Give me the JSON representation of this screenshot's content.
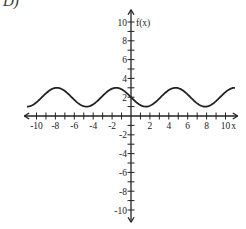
{
  "problem_label": "D)",
  "chart_data": {
    "type": "line",
    "title": "",
    "xlabel": "x",
    "ylabel": "f(x)",
    "xlim": [
      -11,
      11
    ],
    "ylim": [
      -11,
      11
    ],
    "x_ticks": [
      -10,
      -8,
      -6,
      -4,
      -2,
      2,
      4,
      6,
      8,
      10
    ],
    "y_ticks": [
      -10,
      -8,
      -6,
      -4,
      -2,
      2,
      4,
      6,
      8,
      10
    ],
    "grid": false,
    "function": "f(x) = 2 - sin(x)",
    "series": [
      {
        "name": "f(x)",
        "x": [
          -11,
          -10,
          -9,
          -7.85,
          -7,
          -6,
          -4.71,
          -4,
          -3,
          -1.57,
          -1,
          0,
          1,
          1.57,
          2,
          3,
          4,
          4.71,
          5,
          6,
          7,
          7.85,
          9,
          10,
          11
        ],
        "values": [
          3.0,
          1.46,
          2.41,
          3.0,
          2.66,
          1.72,
          1.0,
          1.24,
          2.14,
          3.0,
          2.84,
          2.0,
          1.16,
          1.0,
          1.09,
          1.86,
          2.76,
          3.0,
          2.96,
          2.28,
          1.34,
          1.0,
          1.59,
          2.54,
          3.0
        ]
      }
    ]
  }
}
